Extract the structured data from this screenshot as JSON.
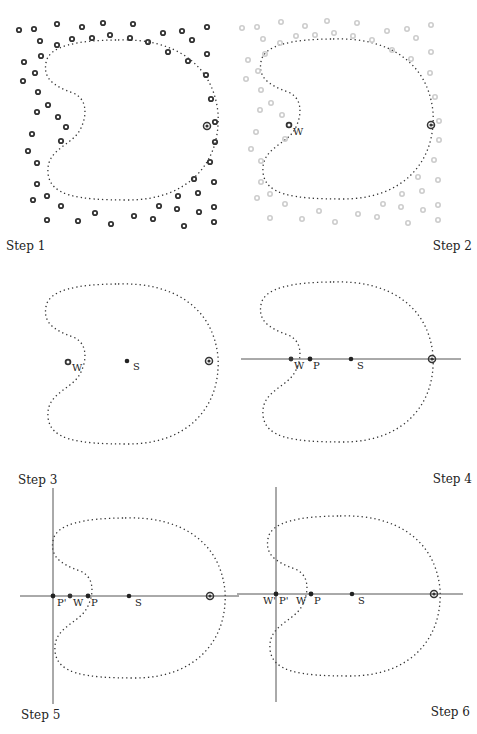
{
  "figure": {
    "panels": [
      {
        "id": 1,
        "caption": "Step 1",
        "caption_align": "left"
      },
      {
        "id": 2,
        "caption": "Step 2",
        "caption_align": "right",
        "point_labels": [
          "W"
        ]
      },
      {
        "id": 3,
        "caption": "Step 3",
        "caption_align": "left",
        "point_labels": [
          "W",
          "S"
        ]
      },
      {
        "id": 4,
        "caption": "Step 4",
        "caption_align": "right",
        "point_labels": [
          "W",
          "P",
          "S"
        ]
      },
      {
        "id": 5,
        "caption": "Step 5",
        "caption_align": "left",
        "point_labels": [
          "P'",
          "W",
          "P",
          "S"
        ]
      },
      {
        "id": 6,
        "caption": "Step 6",
        "caption_align": "right",
        "point_labels": [
          "W'",
          "P'",
          "W",
          "P",
          "S"
        ]
      }
    ],
    "labels": {
      "W": "W",
      "S": "S",
      "P": "P",
      "P_prime": "P'",
      "W_prime": "W'"
    },
    "colors": {
      "point_dark": "#333333",
      "point_faded": "#c8c8c8",
      "curve": "#333333",
      "axis": "#555555"
    }
  }
}
